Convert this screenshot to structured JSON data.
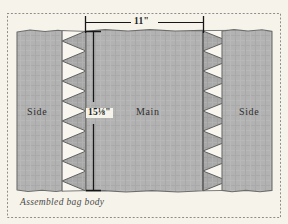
{
  "figure": {
    "caption": "Assembled bag body",
    "frame": {
      "style": "dotted",
      "color": "#8d8d8d"
    },
    "background_color": "#f6f3ea",
    "fabric_color": "#b0b0b0",
    "fabric_outline_color": "#6b6b6b",
    "seam_fill_color": "#f7f5ee",
    "dimension_line_color": "#161616"
  },
  "panels": [
    {
      "id": "side-left",
      "label": "Side"
    },
    {
      "id": "main",
      "label": "Main"
    },
    {
      "id": "side-right",
      "label": "Side"
    }
  ],
  "dimensions": [
    {
      "id": "width-main",
      "label": "11\"",
      "value": 11,
      "unit": "inch",
      "orientation": "horizontal",
      "measures": "Main panel width"
    },
    {
      "id": "height-main",
      "label": "15⅛\"",
      "value": 15.125,
      "unit": "inch",
      "orientation": "vertical",
      "measures": "Main panel height"
    }
  ],
  "seams": [
    {
      "id": "seam-left",
      "type": "zigzag-stitch",
      "direction": "left"
    },
    {
      "id": "seam-right",
      "type": "zigzag-stitch",
      "direction": "right"
    }
  ]
}
